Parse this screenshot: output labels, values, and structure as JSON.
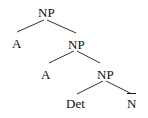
{
  "tree": {
    "nodes": [
      {
        "id": "np1",
        "label": "NP",
        "x": 46,
        "y": 12
      },
      {
        "id": "a1",
        "label": "A",
        "x": 17,
        "y": 43
      },
      {
        "id": "np2",
        "label": "NP",
        "x": 76,
        "y": 44
      },
      {
        "id": "a2",
        "label": "A",
        "x": 46,
        "y": 74
      },
      {
        "id": "np3",
        "label": "NP",
        "x": 105,
        "y": 74
      },
      {
        "id": "det",
        "label": "Det",
        "x": 77,
        "y": 103
      },
      {
        "id": "nbar",
        "label": "N",
        "x": 132,
        "y": 103,
        "overline": true
      }
    ],
    "edges": [
      [
        "np1",
        "a1"
      ],
      [
        "np1",
        "np2"
      ],
      [
        "np2",
        "a2"
      ],
      [
        "np2",
        "np3"
      ],
      [
        "np3",
        "det"
      ],
      [
        "np3",
        "nbar"
      ]
    ],
    "line_color": "#333333"
  }
}
